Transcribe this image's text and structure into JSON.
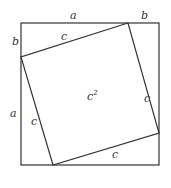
{
  "diagram": {
    "outer_square": {
      "x1": 21,
      "y1": 23,
      "x2": 159,
      "y2": 165
    },
    "inner_square": [
      [
        128,
        23
      ],
      [
        21,
        57
      ],
      [
        53,
        165
      ],
      [
        159,
        133
      ]
    ],
    "labels": {
      "top_a": "a",
      "top_b": "b",
      "left_b": "b",
      "left_a": "a",
      "inner_top_c": "c",
      "inner_right_c": "c",
      "inner_left_c": "c",
      "inner_bottom_c": "c",
      "area_base": "c",
      "area_exp": "2"
    },
    "colors": {
      "stroke": "#333333",
      "background": "#ffffff"
    }
  }
}
